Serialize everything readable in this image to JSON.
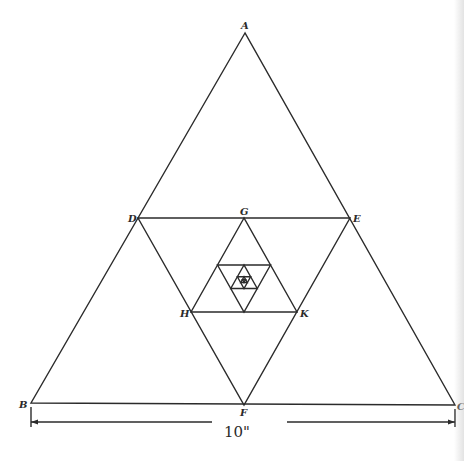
{
  "figure": {
    "stroke_color": "#2b2b2b",
    "background": "#ffffff"
  },
  "vertices": {
    "A": {
      "label": "A",
      "x": 245,
      "y": 33
    },
    "B": {
      "label": "B",
      "x": 31,
      "y": 403
    },
    "C": {
      "label": "C",
      "x": 455,
      "y": 405
    },
    "D": {
      "label": "D",
      "x": 138,
      "y": 218
    },
    "E": {
      "label": "E",
      "x": 350,
      "y": 218
    },
    "F": {
      "label": "F",
      "x": 244,
      "y": 405
    },
    "G": {
      "label": "G",
      "x": 244,
      "y": 218
    },
    "H": {
      "label": "H",
      "x": 191,
      "y": 312
    },
    "K": {
      "label": "K",
      "x": 297,
      "y": 312
    }
  },
  "dimension": {
    "label": "10\"",
    "from_vertex": "B",
    "to_vertex": "C"
  }
}
